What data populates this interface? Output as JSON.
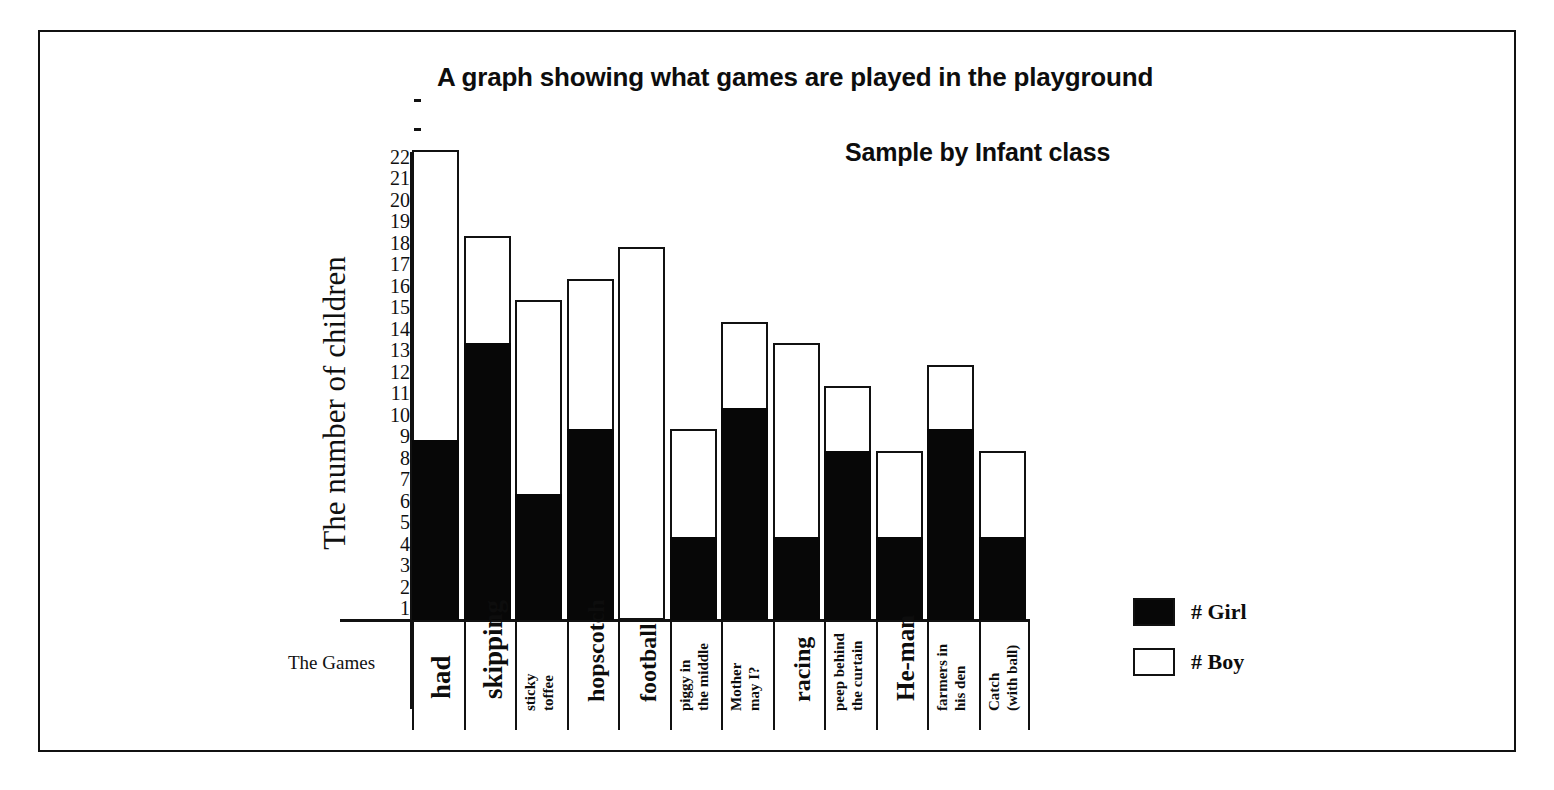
{
  "chart_data": {
    "type": "bar",
    "title": "A graph showing what games are played in the playground",
    "subtitle": "Sample by Infant class",
    "xlabel": "The Games",
    "ylabel": "The number of children",
    "stacked": true,
    "grid": false,
    "legend_position": "right-bottom",
    "ylim": [
      0,
      24
    ],
    "y_ticks": [
      1,
      2,
      3,
      4,
      5,
      6,
      7,
      8,
      9,
      10,
      11,
      12,
      13,
      14,
      15,
      16,
      17,
      18,
      19,
      20,
      21,
      22
    ],
    "y_extra_unlabeled_ticks": 2,
    "categories": [
      "had",
      "skipping",
      "sticky toffee",
      "hopscotch",
      "football",
      "piggy in the middle",
      "Mother may I?",
      "racing",
      "peep behind the curtain",
      "He-man",
      "farmers in his den",
      "Catch (with ball)"
    ],
    "series": [
      {
        "name": "# Girl",
        "color": "#070707",
        "values": [
          9,
          13.5,
          6.5,
          9.5,
          0,
          4.5,
          10.5,
          4.5,
          8.5,
          4.5,
          9.5,
          4.5
        ]
      },
      {
        "name": "# Boy",
        "color": "#ffffff",
        "values": [
          13.5,
          5,
          9,
          7,
          18,
          5,
          4,
          9,
          3,
          4,
          3,
          4
        ]
      }
    ],
    "totals": [
      22.5,
      18.5,
      15.5,
      16.5,
      18,
      9.5,
      14.5,
      13.5,
      11.5,
      8.5,
      12.5,
      8.5
    ]
  },
  "legend": {
    "items": [
      {
        "label": "# Girl",
        "fill": "filled"
      },
      {
        "label": "# Boy",
        "fill": "empty"
      }
    ]
  },
  "axes": {
    "y_title": "The number of children",
    "x_title": "The Games"
  }
}
